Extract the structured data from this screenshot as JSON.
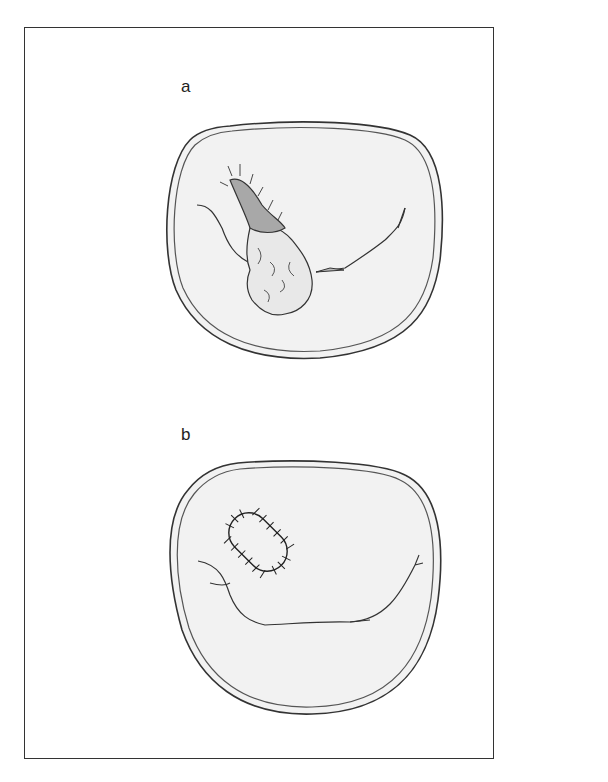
{
  "figure": {
    "panels": [
      {
        "label": "a",
        "description": "Cross-section with torn, frayed flap and fibrous tissue mass"
      },
      {
        "label": "b",
        "description": "Cross-section with sutured oval repair"
      }
    ]
  },
  "colors": {
    "outline": "#333333",
    "fill": "#f2f2f2",
    "flap": "#a8a8a8",
    "mass": "#e8e8e8"
  }
}
